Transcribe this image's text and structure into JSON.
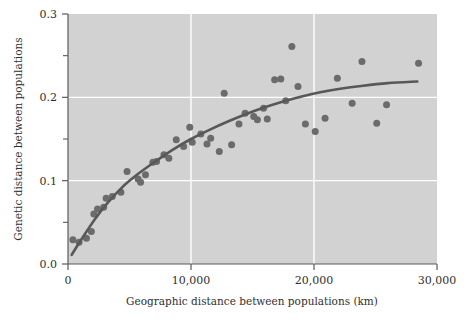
{
  "chart_data": {
    "type": "scatter",
    "title": "",
    "xlabel": "Geographic distance between populations (km)",
    "ylabel": "Genetic distance between populations",
    "xlim": [
      0,
      30000
    ],
    "ylim": [
      0.0,
      0.3
    ],
    "xticks": [
      0,
      10000,
      20000,
      30000
    ],
    "xticklabels": [
      "0",
      "10,000",
      "20,000",
      "30,000"
    ],
    "yticks": [
      0.0,
      0.1,
      0.2,
      0.3
    ],
    "yticklabels": [
      "0.0",
      "0.1",
      "0.2",
      "0.3"
    ],
    "yminorticks": [
      0.05,
      0.15,
      0.25
    ],
    "grid": "white gridlines at x=10,000 and x=20,000 and y=0.1 and y=0.2",
    "legend": "none",
    "plot_background": "#d2d2d2",
    "point_color": "#6b6b6b",
    "line_color": "#585858",
    "axis_color": "#5a5a5a",
    "points": [
      {
        "x": 400,
        "y": 0.029
      },
      {
        "x": 900,
        "y": 0.026
      },
      {
        "x": 1500,
        "y": 0.031
      },
      {
        "x": 1900,
        "y": 0.039
      },
      {
        "x": 2100,
        "y": 0.06
      },
      {
        "x": 2400,
        "y": 0.066
      },
      {
        "x": 2900,
        "y": 0.068
      },
      {
        "x": 3100,
        "y": 0.079
      },
      {
        "x": 3600,
        "y": 0.081
      },
      {
        "x": 4300,
        "y": 0.086
      },
      {
        "x": 4800,
        "y": 0.111
      },
      {
        "x": 5700,
        "y": 0.102
      },
      {
        "x": 5900,
        "y": 0.098
      },
      {
        "x": 6300,
        "y": 0.107
      },
      {
        "x": 6900,
        "y": 0.122
      },
      {
        "x": 7200,
        "y": 0.123
      },
      {
        "x": 7800,
        "y": 0.131
      },
      {
        "x": 8200,
        "y": 0.127
      },
      {
        "x": 8800,
        "y": 0.149
      },
      {
        "x": 9400,
        "y": 0.141
      },
      {
        "x": 9900,
        "y": 0.164
      },
      {
        "x": 10100,
        "y": 0.146
      },
      {
        "x": 10800,
        "y": 0.156
      },
      {
        "x": 11300,
        "y": 0.144
      },
      {
        "x": 11600,
        "y": 0.151
      },
      {
        "x": 12300,
        "y": 0.135
      },
      {
        "x": 12700,
        "y": 0.205
      },
      {
        "x": 13300,
        "y": 0.143
      },
      {
        "x": 13900,
        "y": 0.168
      },
      {
        "x": 14400,
        "y": 0.181
      },
      {
        "x": 15100,
        "y": 0.177
      },
      {
        "x": 15400,
        "y": 0.173
      },
      {
        "x": 15900,
        "y": 0.187
      },
      {
        "x": 16200,
        "y": 0.174
      },
      {
        "x": 16800,
        "y": 0.221
      },
      {
        "x": 17300,
        "y": 0.222
      },
      {
        "x": 17700,
        "y": 0.196
      },
      {
        "x": 18200,
        "y": 0.261
      },
      {
        "x": 18700,
        "y": 0.213
      },
      {
        "x": 19300,
        "y": 0.168
      },
      {
        "x": 20100,
        "y": 0.159
      },
      {
        "x": 20900,
        "y": 0.175
      },
      {
        "x": 21900,
        "y": 0.223
      },
      {
        "x": 23100,
        "y": 0.193
      },
      {
        "x": 23900,
        "y": 0.243
      },
      {
        "x": 25100,
        "y": 0.169
      },
      {
        "x": 25900,
        "y": 0.191
      },
      {
        "x": 28500,
        "y": 0.241
      }
    ],
    "fit_curve": {
      "description": "smooth saturating regression line",
      "points": [
        {
          "x": 300,
          "y": 0.011
        },
        {
          "x": 1200,
          "y": 0.032
        },
        {
          "x": 2200,
          "y": 0.054
        },
        {
          "x": 3200,
          "y": 0.073
        },
        {
          "x": 4400,
          "y": 0.092
        },
        {
          "x": 5600,
          "y": 0.107
        },
        {
          "x": 7000,
          "y": 0.122
        },
        {
          "x": 8500,
          "y": 0.137
        },
        {
          "x": 10000,
          "y": 0.15
        },
        {
          "x": 11500,
          "y": 0.161
        },
        {
          "x": 13000,
          "y": 0.171
        },
        {
          "x": 14500,
          "y": 0.18
        },
        {
          "x": 16000,
          "y": 0.188
        },
        {
          "x": 17500,
          "y": 0.195
        },
        {
          "x": 19000,
          "y": 0.201
        },
        {
          "x": 20500,
          "y": 0.206
        },
        {
          "x": 22000,
          "y": 0.21
        },
        {
          "x": 24000,
          "y": 0.214
        },
        {
          "x": 26000,
          "y": 0.217
        },
        {
          "x": 28400,
          "y": 0.219
        }
      ]
    }
  }
}
